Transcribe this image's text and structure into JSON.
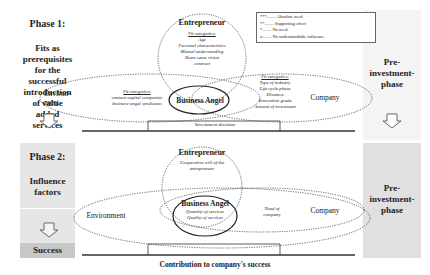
{
  "phase1": {
    "title": "Phase 1:",
    "description": "Fits as prerequisites for the successful introduction of value added services"
  },
  "phase2": {
    "title": "Phase 2:",
    "description": "Influence factors"
  },
  "success": {
    "label": "Success"
  },
  "right_panels": [
    {
      "label": "Pre-investment-phase"
    },
    {
      "label": "Pre-investment-phase"
    }
  ],
  "legend": {
    "items": [
      {
        "symbol": "***",
        "label": "Absolute need"
      },
      {
        "symbol": "**",
        "label": "Supporting effect"
      },
      {
        "symbol": "*",
        "label": "No need"
      },
      {
        "symbol": "o",
        "label": "No understandable influence"
      }
    ]
  },
  "top_diagram": {
    "entrepreneur": {
      "title": "Entrepreneur",
      "fit_header": "Fit categories:",
      "items": [
        "Age",
        "Personal characteristics",
        "Mutual understanding",
        "Share same vision",
        "contract"
      ]
    },
    "environment": {
      "title": "Environ-ment",
      "fit_header": "Fit categories:",
      "items": [
        "venture-capital companies",
        "business-angel syndicates"
      ]
    },
    "business_angel": {
      "title": "Business Angel"
    },
    "company": {
      "title": "Company",
      "fit_header": "Fit categories:",
      "items": [
        "Type of industry",
        "Life cycle phase",
        "Distance",
        "Innovation grade",
        "Amount of investment"
      ]
    },
    "timeline_label": "Investment decision"
  },
  "bottom_diagram": {
    "entrepreneur": {
      "title": "Entrepreneur",
      "items": [
        "Cooperative will of the entrepreneur"
      ]
    },
    "environment": {
      "title": "Environment"
    },
    "business_angel": {
      "title": "Business Angel",
      "items": [
        "Quantity of services",
        "Quality of services"
      ]
    },
    "company": {
      "title": "Company",
      "items": [
        "Need of company"
      ]
    },
    "timeline_label": "Contribution to company's success"
  }
}
